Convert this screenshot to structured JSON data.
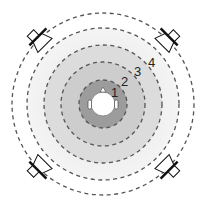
{
  "diagram": {
    "center": {
      "x": 103,
      "y": 104
    },
    "zones": [
      {
        "label": "1",
        "radius": 22,
        "fill": "#9a9a9a",
        "dash_radius": 22
      },
      {
        "label": "2",
        "radius": 38,
        "fill": "#c4c4c4",
        "dash_radius": 38
      },
      {
        "label": "3",
        "radius": 54,
        "fill": "#dadada",
        "dash_radius": 54
      },
      {
        "label": "4",
        "radius": 72,
        "fill": "#ececec",
        "dash_radius": 72
      }
    ],
    "outer_dash_radius": 90,
    "labels": [
      {
        "text": "1",
        "x": 113,
        "y": 96
      },
      {
        "text": "2",
        "x": 122,
        "y": 84
      },
      {
        "text": "3",
        "x": 137,
        "y": 75
      },
      {
        "text": "4",
        "x": 152,
        "y": 66
      }
    ],
    "speakers": [
      {
        "name": "front-left",
        "x": 39,
        "y": 39,
        "angle": -45
      },
      {
        "name": "front-right",
        "x": 167,
        "y": 39,
        "angle": 45
      },
      {
        "name": "rear-left",
        "x": 39,
        "y": 167,
        "angle": -135
      },
      {
        "name": "rear-right",
        "x": 167,
        "y": 167,
        "angle": 135
      }
    ],
    "colors": {
      "dash": "#555555",
      "speaker_stroke": "#111111",
      "head": "#ffffff"
    }
  }
}
